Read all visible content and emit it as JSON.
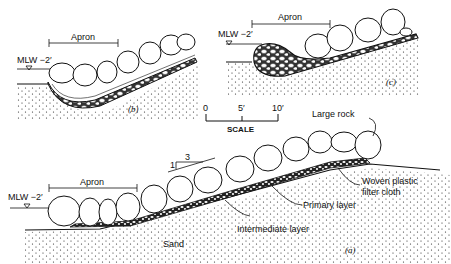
{
  "figure": {
    "panels": [
      {
        "id": "b",
        "caption": "(b)",
        "water_label": "MLW −2′",
        "apron_label": "Apron"
      },
      {
        "id": "c",
        "caption": "(c)",
        "water_label": "MLW −2′",
        "apron_label": "Apron"
      },
      {
        "id": "a",
        "caption": "(a)",
        "water_label": "MLW −2′",
        "apron_label": "Apron",
        "slope": {
          "rise": "1",
          "run": "3"
        },
        "callouts": {
          "large_rock": "Large rock",
          "filter_cloth_line1": "Woven plastic",
          "filter_cloth_line2": "filter cloth",
          "primary_layer": "Primary layer",
          "intermediate_layer": "Intermediate layer",
          "sand": "Sand"
        }
      }
    ],
    "scale": {
      "ticks": [
        "0",
        "5′",
        "10′"
      ],
      "label": "SCALE"
    },
    "colors": {
      "ink": "#111111",
      "paper": "#ffffff"
    }
  }
}
